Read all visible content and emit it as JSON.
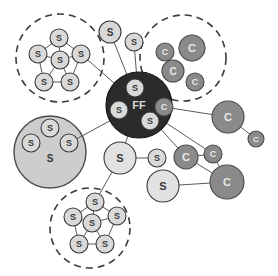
{
  "figure": {
    "background": "#ffffff"
  },
  "palette": {
    "hub_fill": "#2b2b2b",
    "hub_stroke": "#151515",
    "hub_text": "#d8d8d8",
    "s_fill": "#d9d9d9",
    "s_stroke": "#3a3a3a",
    "s_text": "#3a3a3a",
    "s_light_fill": "#e2e2e2",
    "c_fill": "#8a8a8a",
    "c_stroke": "#4a4a4a",
    "c_text": "#e8e8e8",
    "group_fill": "#cdcdcd",
    "group_stroke": "#4a4a4a",
    "dashed_stroke": "#3a3a3a",
    "edge_stroke": "#5a5a5a"
  },
  "labels": {
    "hub": "FF",
    "s": "S",
    "c": "C"
  },
  "groups": [
    {
      "name": "cluster-top-left-s",
      "style": "dashed",
      "cx": 60,
      "cy": 58,
      "r": 44,
      "label": ""
    },
    {
      "name": "cluster-top-right-c",
      "style": "dashed",
      "cx": 183,
      "cy": 58,
      "r": 43,
      "label": ""
    },
    {
      "name": "cluster-bottom-s",
      "style": "dashed",
      "cx": 90,
      "cy": 228,
      "r": 40,
      "label": ""
    },
    {
      "name": "group-left-solid-s",
      "style": "solid",
      "cx": 50,
      "cy": 152,
      "r": 36,
      "label": "S"
    }
  ],
  "nodes": [
    {
      "id": "hub",
      "type": "FF",
      "label": "FF",
      "cx": 139,
      "cy": 105,
      "r": 33,
      "fill": "hub"
    },
    {
      "id": "hub-s-top",
      "type": "S",
      "label": "S",
      "cx": 135,
      "cy": 88,
      "r": 9,
      "fill": "s"
    },
    {
      "id": "hub-s-left",
      "type": "S",
      "label": "S",
      "cx": 119,
      "cy": 110,
      "r": 9,
      "fill": "s"
    },
    {
      "id": "hub-s-bottom",
      "type": "S",
      "label": "S",
      "cx": 150,
      "cy": 121,
      "r": 9,
      "fill": "s"
    },
    {
      "id": "hub-c-right",
      "type": "C",
      "label": "C",
      "cx": 164,
      "cy": 107,
      "r": 9,
      "fill": "c"
    },
    {
      "id": "s-top-a",
      "type": "S",
      "label": "S",
      "cx": 110,
      "cy": 32,
      "r": 11,
      "fill": "s"
    },
    {
      "id": "s-top-b",
      "type": "S",
      "label": "S",
      "cx": 134,
      "cy": 42,
      "r": 9,
      "fill": "s"
    },
    {
      "id": "tl-s-top",
      "type": "S",
      "label": "S",
      "cx": 59,
      "cy": 38,
      "r": 9,
      "fill": "s"
    },
    {
      "id": "tl-s-left",
      "type": "S",
      "label": "S",
      "cx": 38,
      "cy": 54,
      "r": 9,
      "fill": "s"
    },
    {
      "id": "tl-s-right",
      "type": "S",
      "label": "S",
      "cx": 81,
      "cy": 54,
      "r": 9,
      "fill": "s"
    },
    {
      "id": "tl-s-center",
      "type": "S",
      "label": "S",
      "cx": 60,
      "cy": 60,
      "r": 9,
      "fill": "s"
    },
    {
      "id": "tl-s-bl",
      "type": "S",
      "label": "S",
      "cx": 44,
      "cy": 82,
      "r": 9,
      "fill": "s"
    },
    {
      "id": "tl-s-br",
      "type": "S",
      "label": "S",
      "cx": 70,
      "cy": 82,
      "r": 9,
      "fill": "s"
    },
    {
      "id": "bc-s-top",
      "type": "S",
      "label": "S",
      "cx": 95,
      "cy": 202,
      "r": 9,
      "fill": "s"
    },
    {
      "id": "bc-s-left",
      "type": "S",
      "label": "S",
      "cx": 73,
      "cy": 217,
      "r": 9,
      "fill": "s"
    },
    {
      "id": "bc-s-right",
      "type": "S",
      "label": "S",
      "cx": 117,
      "cy": 216,
      "r": 9,
      "fill": "s"
    },
    {
      "id": "bc-s-center",
      "type": "S",
      "label": "S",
      "cx": 92,
      "cy": 223,
      "r": 9,
      "fill": "s"
    },
    {
      "id": "bc-s-bl",
      "type": "S",
      "label": "S",
      "cx": 79,
      "cy": 244,
      "r": 9,
      "fill": "s"
    },
    {
      "id": "bc-s-br",
      "type": "S",
      "label": "S",
      "cx": 105,
      "cy": 244,
      "r": 9,
      "fill": "s"
    },
    {
      "id": "lg-s-top",
      "type": "S",
      "label": "S",
      "cx": 50,
      "cy": 128,
      "r": 9,
      "fill": "s"
    },
    {
      "id": "lg-s-left",
      "type": "S",
      "label": "S",
      "cx": 31,
      "cy": 143,
      "r": 9,
      "fill": "s"
    },
    {
      "id": "lg-s-right",
      "type": "S",
      "label": "S",
      "cx": 69,
      "cy": 143,
      "r": 9,
      "fill": "s"
    },
    {
      "id": "tr-c-big",
      "type": "C",
      "label": "C",
      "cx": 192,
      "cy": 48,
      "r": 13,
      "fill": "c"
    },
    {
      "id": "tr-c-left",
      "type": "C",
      "label": "C",
      "cx": 165,
      "cy": 52,
      "r": 9,
      "fill": "c"
    },
    {
      "id": "tr-c-mid",
      "type": "C",
      "label": "C",
      "cx": 173,
      "cy": 71,
      "r": 11,
      "fill": "c"
    },
    {
      "id": "tr-c-low",
      "type": "C",
      "label": "C",
      "cx": 195,
      "cy": 82,
      "r": 9,
      "fill": "c"
    },
    {
      "id": "r-c-big",
      "type": "C",
      "label": "C",
      "cx": 228,
      "cy": 117,
      "r": 16,
      "fill": "c"
    },
    {
      "id": "r-c-small",
      "type": "C",
      "label": "C",
      "cx": 256,
      "cy": 139,
      "r": 8,
      "fill": "c"
    },
    {
      "id": "s-mid",
      "type": "S",
      "label": "S",
      "cx": 120,
      "cy": 158,
      "r": 16,
      "fill": "s-light"
    },
    {
      "id": "s-mid-right",
      "type": "S",
      "label": "S",
      "cx": 157,
      "cy": 158,
      "r": 9,
      "fill": "s"
    },
    {
      "id": "s-low",
      "type": "S",
      "label": "S",
      "cx": 163,
      "cy": 186,
      "r": 16,
      "fill": "s-light"
    },
    {
      "id": "br-c-mid",
      "type": "C",
      "label": "C",
      "cx": 186,
      "cy": 157,
      "r": 12,
      "fill": "c"
    },
    {
      "id": "br-c-small",
      "type": "C",
      "label": "C",
      "cx": 213,
      "cy": 154,
      "r": 9,
      "fill": "c"
    },
    {
      "id": "br-c-big",
      "type": "C",
      "label": "C",
      "cx": 227,
      "cy": 182,
      "r": 17,
      "fill": "c"
    }
  ],
  "edges": [
    {
      "from": "s-top-a",
      "to": "hub"
    },
    {
      "from": "s-top-b",
      "to": "hub"
    },
    {
      "from": "tl-s-right",
      "to": "hub"
    },
    {
      "from": "lg-s-right",
      "to": "hub"
    },
    {
      "from": "hub",
      "to": "s-mid"
    },
    {
      "from": "hub",
      "to": "br-c-mid"
    },
    {
      "from": "hub",
      "to": "br-c-small"
    },
    {
      "from": "hub-c-right",
      "to": "r-c-big"
    },
    {
      "from": "r-c-big",
      "to": "r-c-small"
    },
    {
      "from": "s-mid",
      "to": "s-mid-right"
    },
    {
      "from": "s-mid",
      "to": "bc-s-top"
    },
    {
      "from": "br-c-mid",
      "to": "br-c-small"
    },
    {
      "from": "br-c-mid",
      "to": "br-c-big"
    },
    {
      "from": "br-c-small",
      "to": "br-c-big"
    },
    {
      "from": "s-low",
      "to": "br-c-big"
    },
    {
      "from": "tl-s-top",
      "to": "tl-s-left"
    },
    {
      "from": "tl-s-top",
      "to": "tl-s-right"
    },
    {
      "from": "tl-s-top",
      "to": "tl-s-center"
    },
    {
      "from": "tl-s-left",
      "to": "tl-s-bl"
    },
    {
      "from": "tl-s-left",
      "to": "tl-s-center"
    },
    {
      "from": "tl-s-right",
      "to": "tl-s-br"
    },
    {
      "from": "tl-s-right",
      "to": "tl-s-center"
    },
    {
      "from": "tl-s-bl",
      "to": "tl-s-br"
    },
    {
      "from": "tl-s-bl",
      "to": "tl-s-center"
    },
    {
      "from": "tl-s-br",
      "to": "tl-s-center"
    },
    {
      "from": "bc-s-top",
      "to": "bc-s-left"
    },
    {
      "from": "bc-s-top",
      "to": "bc-s-right"
    },
    {
      "from": "bc-s-top",
      "to": "bc-s-center"
    },
    {
      "from": "bc-s-left",
      "to": "bc-s-bl"
    },
    {
      "from": "bc-s-left",
      "to": "bc-s-center"
    },
    {
      "from": "bc-s-right",
      "to": "bc-s-br"
    },
    {
      "from": "bc-s-right",
      "to": "bc-s-center"
    },
    {
      "from": "bc-s-bl",
      "to": "bc-s-br"
    },
    {
      "from": "bc-s-bl",
      "to": "bc-s-center"
    },
    {
      "from": "bc-s-br",
      "to": "bc-s-center"
    }
  ]
}
